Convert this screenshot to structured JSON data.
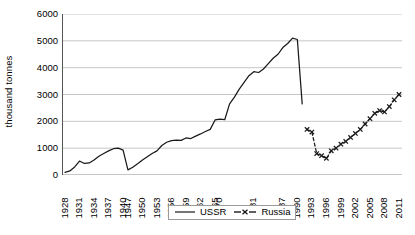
{
  "chart_data": {
    "type": "line",
    "title": "",
    "xlabel": "",
    "ylabel": "thousand tonnes",
    "ylim": [
      0,
      6000
    ],
    "ytick_values": [
      0,
      1000,
      2000,
      3000,
      4000,
      5000,
      6000
    ],
    "ytick_labels": [
      "0",
      "1000",
      "2000",
      "3000",
      "4000",
      "5000",
      "6000"
    ],
    "grid": "horizontal",
    "legend_position": "bottom-center",
    "x": [
      "1928",
      "1929",
      "1930",
      "1931",
      "1932",
      "1933",
      "1934",
      "1935",
      "1936",
      "1937",
      "1938",
      "1939",
      "1940",
      "1947",
      "1948",
      "1949",
      "1950",
      "1951",
      "1952",
      "1953",
      "1954",
      "1955",
      "1956",
      "1957",
      "1958",
      "1959",
      "1960",
      "1961",
      "1962",
      "1963",
      "1964",
      "1965",
      "1970",
      "1975",
      "1976",
      "1977",
      "1978",
      "1979",
      "1980",
      "1981",
      "1982",
      "1983",
      "1984",
      "1985",
      "1986",
      "1987",
      "1988",
      "1989",
      "1990",
      "1991",
      "1992",
      "1993",
      "1994",
      "1995",
      "1996",
      "1997",
      "1998",
      "1999",
      "2000",
      "2001",
      "2002",
      "2003",
      "2004",
      "2005",
      "2006",
      "2007",
      "2008",
      "2009",
      "2010",
      "2011"
    ],
    "xtick_labels_shown": [
      "1928",
      "1931",
      "1934",
      "1937",
      "1940",
      "1947",
      "1950",
      "1953",
      "1956",
      "1959",
      "1962",
      "1965",
      "1970",
      "1981",
      "1987",
      "1990",
      "1993",
      "1996",
      "1999",
      "2002",
      "2005",
      "2008",
      "2011"
    ],
    "series": [
      {
        "name": "USSR",
        "style": "solid-line",
        "color": "#1a1a1a",
        "marker": "none",
        "x": [
          "1928",
          "1929",
          "1930",
          "1931",
          "1932",
          "1933",
          "1934",
          "1935",
          "1936",
          "1937",
          "1938",
          "1939",
          "1940",
          "1947",
          "1948",
          "1949",
          "1950",
          "1951",
          "1952",
          "1953",
          "1954",
          "1955",
          "1956",
          "1957",
          "1958",
          "1959",
          "1960",
          "1961",
          "1962",
          "1963",
          "1964",
          "1965",
          "1970",
          "1975",
          "1976",
          "1977",
          "1978",
          "1979",
          "1980",
          "1981",
          "1982",
          "1983",
          "1984",
          "1985",
          "1986",
          "1987",
          "1988",
          "1989",
          "1990",
          "1991"
        ],
        "values": [
          100,
          150,
          300,
          520,
          430,
          450,
          560,
          700,
          800,
          900,
          980,
          1000,
          930,
          190,
          290,
          420,
          560,
          680,
          800,
          900,
          1100,
          1220,
          1280,
          1300,
          1290,
          1380,
          1360,
          1450,
          1530,
          1620,
          1700,
          2050,
          2080,
          2060,
          2650,
          2900,
          3200,
          3450,
          3700,
          3850,
          3820,
          3950,
          4150,
          4350,
          4500,
          4750,
          4900,
          5100,
          5050,
          2650
        ]
      },
      {
        "name": "Russia",
        "style": "dashed-line",
        "color": "#1a1a1a",
        "marker": "x",
        "x": [
          "1992",
          "1993",
          "1994",
          "1995",
          "1996",
          "1997",
          "1998",
          "1999",
          "2000",
          "2001",
          "2002",
          "2003",
          "2004",
          "2005",
          "2006",
          "2007",
          "2008",
          "2009",
          "2010",
          "2011"
        ],
        "values": [
          1700,
          1600,
          800,
          720,
          620,
          900,
          1000,
          1150,
          1250,
          1400,
          1550,
          1700,
          1900,
          2100,
          2300,
          2400,
          2350,
          2550,
          2800,
          3000
        ]
      }
    ]
  },
  "legend": {
    "items": [
      {
        "label": "USSR",
        "style": "solid-line"
      },
      {
        "label": "Russia",
        "style": "dashed-marker"
      }
    ]
  }
}
